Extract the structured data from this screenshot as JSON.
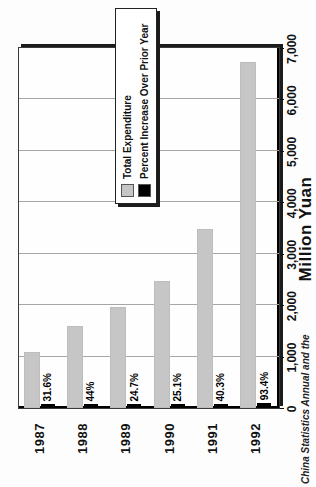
{
  "chart_data": {
    "type": "bar",
    "orientation": "horizontal",
    "page_rotation": "chart printed rotated 90deg counter-clockwise on portrait page",
    "categories": [
      "1987",
      "1988",
      "1989",
      "1990",
      "1991",
      "1992"
    ],
    "series": [
      {
        "name": "Total Expenditure",
        "color": "#c6c6c6",
        "values": [
          1090,
          1590,
          1970,
          2475,
          3480,
          6730
        ]
      },
      {
        "name": "Percent Increase Over Prior Year",
        "color": "#000000",
        "values": [
          31.6,
          44,
          24.7,
          25.1,
          40.3,
          93.4
        ],
        "value_labels": [
          "31.6%",
          "44%",
          "24.7%",
          "25.1%",
          "40.3%",
          "93.4%"
        ]
      }
    ],
    "xlabel": "Million Yuan",
    "xlim": [
      0,
      7000
    ],
    "xticks": [
      0,
      1000,
      2000,
      3000,
      4000,
      5000,
      6000,
      7000
    ],
    "xtick_labels": [
      "0",
      "1,000",
      "2,000",
      "3,000",
      "4,000",
      "5,000",
      "6,000",
      "7,000"
    ],
    "grid": true,
    "legend_position": "inside-upper-right"
  },
  "caption": "China Statistics Annual and the"
}
